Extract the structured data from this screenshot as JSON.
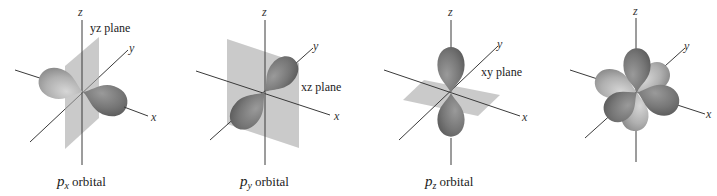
{
  "panels": [
    {
      "axes": {
        "x": "x",
        "y": "y",
        "z": "z"
      },
      "plane_label": "yz plane",
      "caption": {
        "symbol": "p",
        "subscript": "x",
        "text": "orbital"
      }
    },
    {
      "axes": {
        "x": "x",
        "y": "y",
        "z": "z"
      },
      "plane_label": "xz plane",
      "caption": {
        "symbol": "p",
        "subscript": "y",
        "text": "orbital"
      }
    },
    {
      "axes": {
        "x": "x",
        "y": "y",
        "z": "z"
      },
      "plane_label": "xy plane",
      "caption": {
        "symbol": "p",
        "subscript": "z",
        "text": "orbital"
      }
    },
    {
      "axes": {
        "x": "x",
        "y": "y",
        "z": "z"
      }
    }
  ],
  "colors": {
    "lobe_light": "#b8b8b8",
    "lobe_dark": "#787878",
    "plane": "#a7a7a7",
    "axis": "#3a3a3a"
  }
}
